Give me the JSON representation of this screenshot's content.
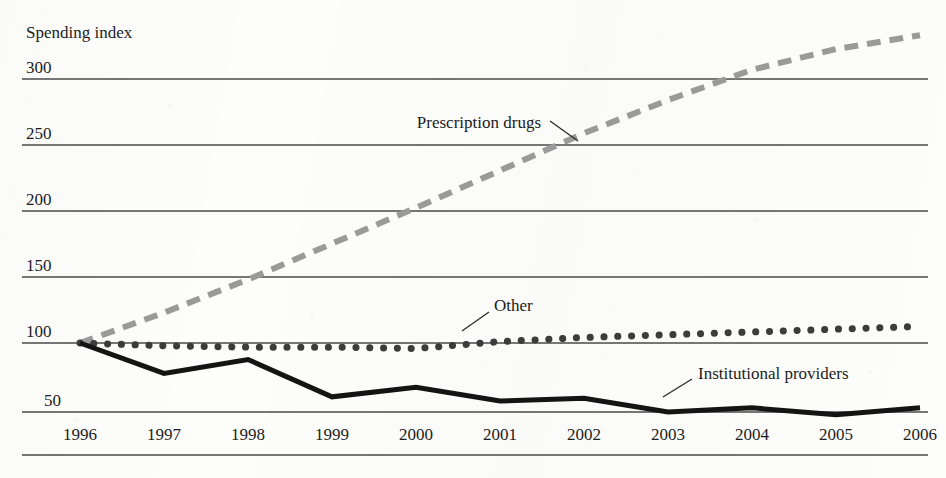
{
  "figure": {
    "y_axis_title": "Spending index",
    "background_color": "#fdfdfc",
    "gridline_color": "#4a4a4a",
    "axis_rule_color": "#4a4a4a"
  },
  "labels": {
    "y_300": "300",
    "y_250": "250",
    "y_200": "200",
    "y_150": "150",
    "y_100": "100",
    "y_50": "50",
    "x_1996": "1996",
    "x_1997": "1997",
    "x_1998": "1998",
    "x_1999": "1999",
    "x_2000": "2000",
    "x_2001": "2001",
    "x_2002": "2002",
    "x_2003": "2003",
    "x_2004": "2004",
    "x_2005": "2005",
    "x_2006": "2006",
    "series_prescription_drugs": "Prescription drugs",
    "series_other": "Other",
    "series_institutional_providers": "Institutional providers"
  },
  "chart_data": {
    "type": "line",
    "title": "",
    "subtitle": "",
    "xlabel": "",
    "ylabel": "Spending index",
    "x": [
      1996,
      1997,
      1998,
      1999,
      2000,
      2001,
      2002,
      2003,
      2004,
      2005,
      2006
    ],
    "categories": [
      "1996",
      "1997",
      "1998",
      "1999",
      "2000",
      "2001",
      "2002",
      "2003",
      "2004",
      "2005",
      "2006"
    ],
    "xlim": [
      1996,
      2006
    ],
    "ylim": [
      40,
      330
    ],
    "yticks": [
      50,
      100,
      150,
      200,
      250,
      300
    ],
    "xticks": [
      1996,
      1997,
      1998,
      1999,
      2000,
      2001,
      2002,
      2003,
      2004,
      2005,
      2006
    ],
    "grid": true,
    "grid_axis": "y",
    "legend": "inline-annotations",
    "series": [
      {
        "name": "Prescription drugs",
        "style": "dashed",
        "color": "#9a9a9a",
        "width": 6,
        "values": [
          100,
          122,
          146,
          172,
          198,
          225,
          252,
          276,
          298,
          313,
          323
        ],
        "label_position": {
          "x": 485,
          "y": 124
        },
        "leader_line": {
          "x1": 550,
          "y1": 122,
          "x2": 578,
          "y2": 140
        }
      },
      {
        "name": "Other",
        "style": "dotted",
        "color": "#3c3c3c",
        "width": 7,
        "values": [
          100,
          98,
          97,
          97,
          96,
          101,
          104,
          106,
          108,
          110,
          112
        ],
        "label_position": {
          "x": 496,
          "y": 310
        },
        "leader_line": {
          "x1": 463,
          "y1": 329,
          "x2": 490,
          "y2": 311
        }
      },
      {
        "name": "Institutional providers",
        "style": "solid",
        "color": "#141414",
        "width": 5,
        "values": [
          100,
          78,
          88,
          61,
          68,
          58,
          60,
          50,
          53,
          48,
          53
        ],
        "label_position": {
          "x": 700,
          "y": 379
        },
        "leader_line": {
          "x1": 664,
          "y1": 396,
          "x2": 694,
          "y2": 379
        }
      }
    ]
  }
}
